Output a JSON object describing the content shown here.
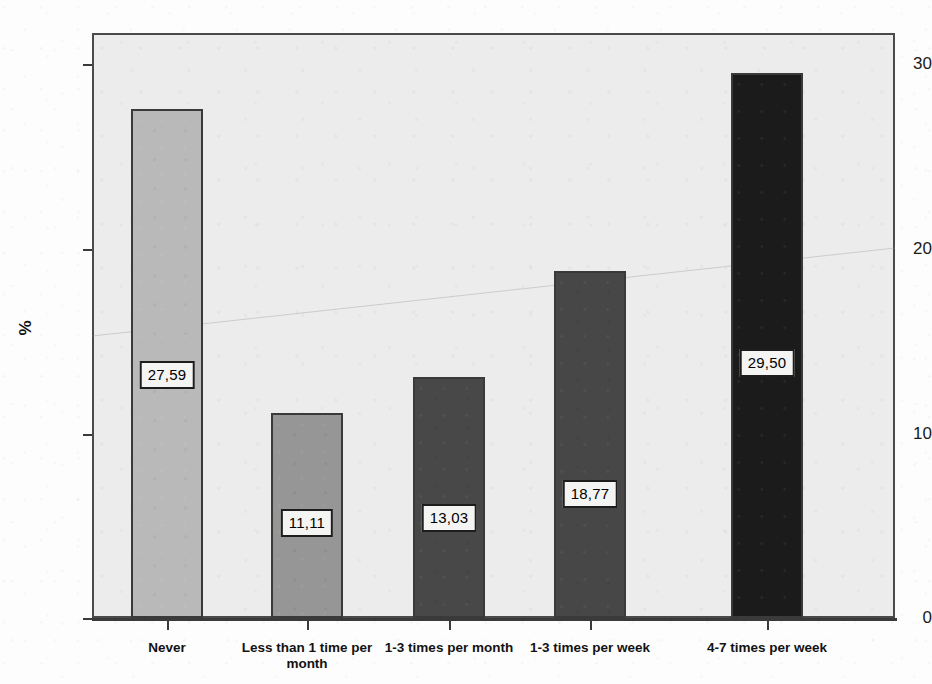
{
  "chart_data": {
    "type": "bar",
    "title": "",
    "subtitle": "",
    "xlabel": "",
    "ylabel": "%",
    "ylim": [
      0,
      31.5
    ],
    "yticks": [
      "0",
      "10",
      "20",
      "30"
    ],
    "ytick_values": [
      0,
      10,
      20,
      30
    ],
    "grid": false,
    "legend": null,
    "categories": [
      "Never",
      "Less than 1 time per month",
      "1-3 times per month",
      "1-3 times per week",
      "4-7 times per week"
    ],
    "values": [
      27.59,
      11.11,
      13.03,
      18.77,
      29.5
    ],
    "value_labels": [
      "27,59",
      "11,11",
      "13,03",
      "18,77",
      "29,50"
    ],
    "bar_colors": [
      "#b9b9b9",
      "#969696",
      "#484848",
      "#474747",
      "#1b1b1b"
    ],
    "bar_border_color": "#3a3a3a",
    "plot_background": "#ececed",
    "axis_color": "#3a3a3a",
    "label_box_background": "#f4f4f2",
    "label_box_border": "#1d1d1d"
  },
  "axis": {
    "y_title": "%",
    "y_tick_0": "0",
    "y_tick_10": "10",
    "y_tick_20": "20",
    "y_tick_30": "30"
  },
  "bars": [
    {
      "category": "Never",
      "value_label": "27,59"
    },
    {
      "category": "Less than 1 time per month",
      "value_label": "11,11"
    },
    {
      "category": "1-3 times per month",
      "value_label": "13,03"
    },
    {
      "category": "1-3 times per week",
      "value_label": "18,77"
    },
    {
      "category": "4-7 times per week",
      "value_label": "29,50"
    }
  ]
}
